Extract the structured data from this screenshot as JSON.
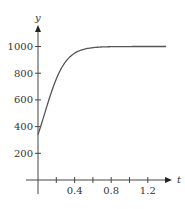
{
  "chart_data": {
    "type": "line",
    "title": "",
    "xlabel": "t",
    "ylabel": "y",
    "xlim": [
      0,
      1.4
    ],
    "ylim": [
      0,
      1050
    ],
    "grid": false,
    "legend": null,
    "x_ticks": [
      0.2,
      0.4,
      0.6,
      0.8,
      1.0,
      1.2
    ],
    "x_tick_labels": [
      "0.4",
      "0.8",
      "1.2"
    ],
    "x_tick_label_values": [
      0.4,
      0.8,
      1.2
    ],
    "y_ticks": [
      200,
      400,
      600,
      800,
      1000
    ],
    "y_tick_labels": [
      "200",
      "400",
      "600",
      "800",
      "1000"
    ],
    "series": [
      {
        "name": "y(t)",
        "color": "#555555",
        "x": [
          0,
          0.05,
          0.1,
          0.15,
          0.2,
          0.25,
          0.3,
          0.35,
          0.4,
          0.45,
          0.5,
          0.6,
          0.7,
          0.8,
          1.0,
          1.2,
          1.4
        ],
        "y": [
          340,
          440,
          560,
          680,
          780,
          860,
          915,
          950,
          972,
          985,
          992,
          997,
          999,
          1000,
          1000,
          1000,
          1000
        ]
      }
    ]
  }
}
